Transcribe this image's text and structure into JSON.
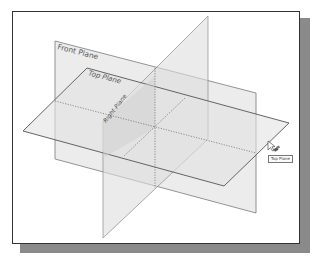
{
  "viewport": {
    "planes": [
      {
        "id": "front",
        "label": "Front Plane"
      },
      {
        "id": "top",
        "label": "Top Plane"
      },
      {
        "id": "right",
        "label": "Right Plane"
      }
    ],
    "hover_tooltip": "Top Plane",
    "icons": [
      "cursor-arrow-icon",
      "plane-select-icon"
    ],
    "colors": {
      "plane_fill": "#e4e4e4",
      "plane_edge": "#6a6a6a",
      "frame_border": "#333333",
      "shadow": "#8a8a8a"
    }
  }
}
